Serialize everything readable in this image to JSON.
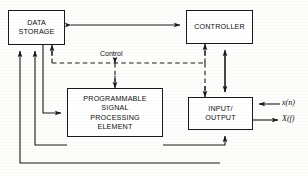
{
  "diagram": {
    "blocks": [
      {
        "id": "data_storage",
        "label": "DATA\nSTORAGE"
      },
      {
        "id": "controller",
        "label": "CONTROLLER"
      },
      {
        "id": "pspe",
        "label": "PROGRAMMABLE\nSIGNAL\nPROCESSING\nELEMENT"
      },
      {
        "id": "input_output",
        "label": "INPUT/\nOUTPUT"
      }
    ],
    "labels": {
      "control": "Control",
      "input_signal": "x(n)",
      "output_signal": "X(f)"
    },
    "colors": {
      "line": "#1a1a1a",
      "box_fill": "#ffffff",
      "background": "#fdfdfb",
      "text": "#111111"
    },
    "connections": [
      {
        "from": "data_storage",
        "to": "controller",
        "style": "solid",
        "arrows": "both"
      },
      {
        "from": "control_bus",
        "to": "data_storage",
        "style": "dashed",
        "arrows": "single"
      },
      {
        "from": "control_bus",
        "to": "pspe",
        "style": "dashed",
        "arrows": "single"
      },
      {
        "from": "control_bus",
        "to": "controller",
        "style": "dashed",
        "arrows": "single"
      },
      {
        "from": "control_bus",
        "to": "input_output",
        "style": "dashed",
        "arrows": "single"
      },
      {
        "from": "data_storage",
        "to": "pspe",
        "style": "solid",
        "arrows": "single"
      },
      {
        "from": "pspe",
        "to": "data_storage",
        "style": "solid",
        "arrows": "single"
      },
      {
        "from": "input_output",
        "to": "data_storage",
        "style": "solid",
        "arrows": "single"
      },
      {
        "from": "controller",
        "to": "input_output",
        "style": "solid",
        "arrows": "both"
      },
      {
        "from": "pspe",
        "to": "input_output",
        "style": "solid",
        "arrows": "single"
      },
      {
        "from": "external",
        "to": "input_output",
        "style": "solid",
        "arrows": "single",
        "label": "x(n)"
      },
      {
        "from": "input_output",
        "to": "external",
        "style": "solid",
        "arrows": "single",
        "label": "X(f)"
      }
    ]
  }
}
